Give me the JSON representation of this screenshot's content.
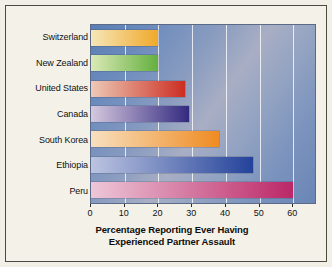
{
  "chart_data": {
    "type": "bar",
    "orientation": "horizontal",
    "title": "",
    "xlabel": "Percentage Reporting Ever Having Experienced Partner Assault",
    "xlabel_line1": "Percentage Reporting Ever Having",
    "xlabel_line2": "Experienced Partner Assault",
    "ylabel": "",
    "categories": [
      "Switzerland",
      "New Zealand",
      "United States",
      "Canada",
      "South Korea",
      "Ethiopia",
      "Peru"
    ],
    "values": [
      20,
      20,
      28,
      29,
      38,
      48,
      60
    ],
    "xlim": [
      0,
      67
    ],
    "xticks": [
      0,
      10,
      20,
      30,
      40,
      50,
      60
    ],
    "ytick_labels": [
      "Switzerland",
      "New Zealand",
      "United States",
      "Canada",
      "South Korea",
      "Ethiopia",
      "Peru"
    ],
    "grid": "vertical-white",
    "legend": "none",
    "bar_colors": [
      {
        "category": "Switzerland",
        "start": "#f6e6b8",
        "end": "#f0a92a"
      },
      {
        "category": "New Zealand",
        "start": "#dbe9b6",
        "end": "#63b03f"
      },
      {
        "category": "United States",
        "start": "#edc9b6",
        "end": "#cc2e22"
      },
      {
        "category": "Canada",
        "start": "#d5c8de",
        "end": "#332a80"
      },
      {
        "category": "South Korea",
        "start": "#f7e0c0",
        "end": "#ef8b22"
      },
      {
        "category": "Ethiopia",
        "start": "#bcc4e0",
        "end": "#23429a"
      },
      {
        "category": "Peru",
        "start": "#edc7d8",
        "end": "#bb2767"
      }
    ],
    "plot_background": "#7b93bd",
    "figure_background": "#f4f2e8",
    "border_color": "#4a4a45"
  }
}
